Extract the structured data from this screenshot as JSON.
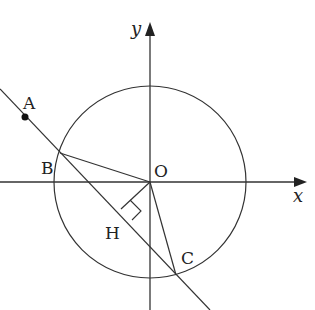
{
  "diagram": {
    "type": "geometry",
    "axes": {
      "x_label": "x",
      "y_label": "y"
    },
    "origin": {
      "label": "O",
      "px": [
        150,
        182
      ]
    },
    "circle": {
      "center": "O",
      "radius_px": 96
    },
    "points": [
      {
        "label": "A",
        "px": [
          27,
          117
        ],
        "marked": true
      },
      {
        "label": "B",
        "px": [
          60,
          153
        ]
      },
      {
        "label": "C",
        "px": [
          176,
          275
        ]
      },
      {
        "label": "H",
        "px": [
          131,
          219
        ]
      }
    ],
    "segments": [
      {
        "from": "B",
        "to": "O"
      },
      {
        "from": "O",
        "to": "C"
      },
      {
        "from": "O",
        "to": "H"
      }
    ],
    "line": {
      "through": [
        "A",
        "B",
        "H",
        "C"
      ]
    },
    "right_angle_at": "H",
    "colors": {
      "stroke": "#333333",
      "background": "#ffffff"
    }
  }
}
